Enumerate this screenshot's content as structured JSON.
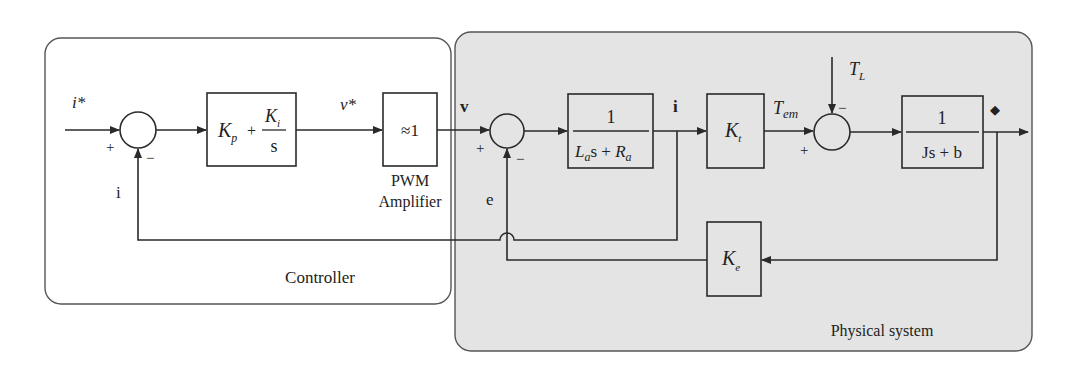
{
  "regions": {
    "controller": {
      "label": "Controller",
      "fill": "#ffffff"
    },
    "physical": {
      "label": "Physical system",
      "fill": "#e4e4e4"
    }
  },
  "blocks": {
    "pi": {
      "kp": "K",
      "kp_sub": "p",
      "plus": "+",
      "ki": "K",
      "ki_sub": "i",
      "den": "s"
    },
    "pwm": {
      "label": "≈1",
      "caption_line1": "PWM",
      "caption_line2": "Amplifier"
    },
    "electrical": {
      "num": "1",
      "den_L": "L",
      "den_L_sub": "a",
      "den_mid": "s + ",
      "den_R": "R",
      "den_R_sub": "a"
    },
    "kt": {
      "label": "K",
      "sub": "t"
    },
    "mechanical": {
      "num": "1",
      "den": "Js + b"
    },
    "ke": {
      "label": "K",
      "sub": "e"
    }
  },
  "signals": {
    "i_ref": "i*",
    "v_ref": "v*",
    "v": "v",
    "i_out": "i",
    "i_feedback": "i",
    "e": "e",
    "tem": "T",
    "tem_sub": "em",
    "tl": "T",
    "tl_sub": "L",
    "omega": "◆"
  },
  "signs": {
    "plus": "+",
    "minus": "−"
  }
}
